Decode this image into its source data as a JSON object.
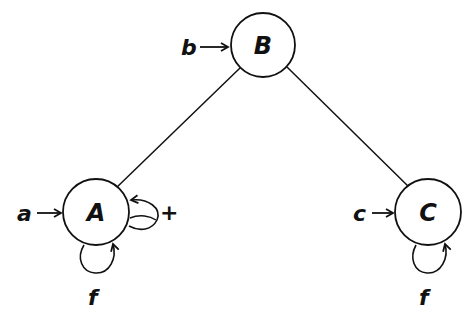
{
  "diagram": {
    "nodes": [
      {
        "id": "B",
        "label": "B",
        "input": "b",
        "cx": 263,
        "cy": 45,
        "r": 32
      },
      {
        "id": "A",
        "label": "A",
        "input": "a",
        "cx": 96,
        "cy": 212,
        "r": 33
      },
      {
        "id": "C",
        "label": "C",
        "input": "c",
        "cx": 428,
        "cy": 212,
        "r": 33
      }
    ],
    "edges": [
      {
        "from": "B",
        "to": "A"
      },
      {
        "from": "B",
        "to": "C"
      }
    ],
    "self_loops": [
      {
        "node": "A",
        "side": "right",
        "label": "+"
      },
      {
        "node": "A",
        "side": "bottom",
        "label": "f"
      },
      {
        "node": "C",
        "side": "bottom",
        "label": "f"
      }
    ],
    "labels": {
      "node_b": "B",
      "node_a": "A",
      "node_c": "C",
      "input_b": "b",
      "input_a": "a",
      "input_c": "c",
      "loop_a_right": "+",
      "loop_a_bottom": "f",
      "loop_c_bottom": "f"
    },
    "colors": {
      "stroke": "#111111",
      "background": "#ffffff"
    }
  }
}
